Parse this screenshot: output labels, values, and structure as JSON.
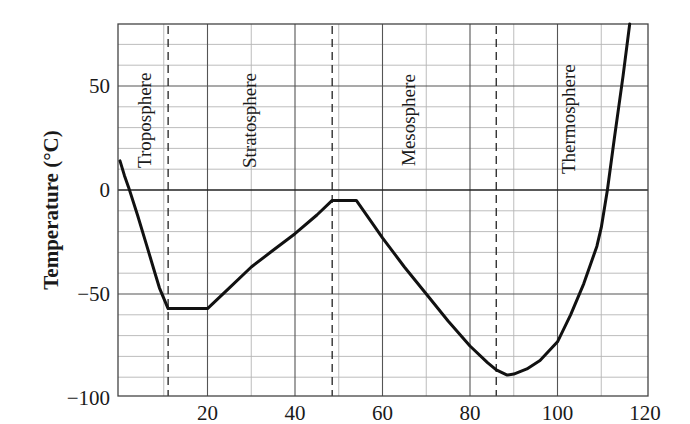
{
  "chart_data": {
    "type": "line",
    "title": "",
    "xlabel": "",
    "ylabel": "Temperature (°C)",
    "xlim": [
      0,
      120
    ],
    "ylim": [
      -100,
      80
    ],
    "x_ticks": [
      20,
      40,
      60,
      80,
      100,
      120
    ],
    "x_tick_labels": [
      "20",
      "40",
      "60",
      "80",
      "100",
      "120"
    ],
    "y_ticks": [
      -100,
      -50,
      0,
      50
    ],
    "y_tick_labels": [
      "−100",
      "−50",
      "0",
      "50"
    ],
    "grid": {
      "major_x": 20,
      "minor_x": 10,
      "major_y": 50,
      "minor_y": 10,
      "on": true
    },
    "zero_line": true,
    "boundaries": [
      {
        "name": "Tropopause",
        "x": 11
      },
      {
        "name": "Stratopause",
        "x": 48.5
      },
      {
        "name": "Mesopause",
        "x": 86
      }
    ],
    "regions": [
      {
        "label": "Troposphere",
        "x": 6
      },
      {
        "label": "Stratosphere",
        "x": 30
      },
      {
        "label": "Mesosphere",
        "x": 68
      },
      {
        "label": "Thermosphere",
        "x": 104
      }
    ],
    "series": [
      {
        "name": "Atmospheric temperature profile",
        "x": [
          0,
          1,
          2,
          4,
          6,
          8,
          9,
          11,
          20,
          25,
          30,
          35,
          40,
          45,
          48.5,
          54,
          58,
          60,
          65,
          70,
          75,
          80,
          84,
          86,
          88.5,
          90,
          93,
          96,
          100,
          103,
          106,
          109,
          110,
          111.4,
          113,
          115,
          116.5
        ],
        "y": [
          14,
          7,
          1,
          -12,
          -26,
          -40,
          -47,
          -57,
          -57,
          -47,
          -37,
          -29,
          -21,
          -12,
          -5,
          -5,
          -17,
          -23,
          -37,
          -50,
          -63,
          -75,
          -83,
          -86.5,
          -89,
          -88.5,
          -86,
          -82,
          -73,
          -60,
          -45,
          -27,
          -18,
          0,
          25,
          55,
          82
        ]
      }
    ]
  },
  "axes": {
    "y_title": "Temperature (°C)",
    "y_ticks": [
      {
        "value": 50,
        "label": "50"
      },
      {
        "value": 0,
        "label": "0"
      },
      {
        "value": -50,
        "label": "−50"
      },
      {
        "value": -100,
        "label": "−100"
      }
    ],
    "x_ticks": [
      {
        "value": 20,
        "label": "20"
      },
      {
        "value": 40,
        "label": "40"
      },
      {
        "value": 60,
        "label": "60"
      },
      {
        "value": 80,
        "label": "80"
      },
      {
        "value": 100,
        "label": "100"
      },
      {
        "value": 120,
        "label": "120"
      }
    ]
  },
  "regions": {
    "troposphere": "Troposphere",
    "stratosphere": "Stratosphere",
    "mesosphere": "Mesosphere",
    "thermosphere": "Thermosphere"
  },
  "colors": {
    "curve": "#111111",
    "major_grid": "#555555",
    "minor_grid": "#b5b5b5",
    "frame": "#444444",
    "dashed": "#222222",
    "text": "#1a1a1a"
  }
}
